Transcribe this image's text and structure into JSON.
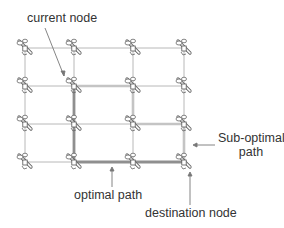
{
  "diagram": {
    "labels": {
      "current_node": "current node",
      "sub_optimal_line1": "Sub-optimal",
      "sub_optimal_line2": "path",
      "optimal_path": "optimal path",
      "destination_node": "destination node"
    },
    "grid": {
      "columns_x": [
        25,
        74,
        133,
        184
      ],
      "rows_y": [
        48,
        86,
        124,
        162
      ],
      "node_icon": "drone-icon"
    },
    "optimal_path": [
      [
        74,
        86
      ],
      [
        74,
        162
      ],
      [
        184,
        162
      ]
    ],
    "sub_optimal_path": [
      [
        74,
        86
      ],
      [
        133,
        86
      ],
      [
        133,
        124
      ],
      [
        184,
        124
      ],
      [
        184,
        162
      ]
    ],
    "colors": {
      "grid_line": "#b8b8b8",
      "optimal_path": "#8f8f8f",
      "sub_optimal_path": "#c4c4c4",
      "arrow": "#777777",
      "text": "#333333"
    }
  }
}
